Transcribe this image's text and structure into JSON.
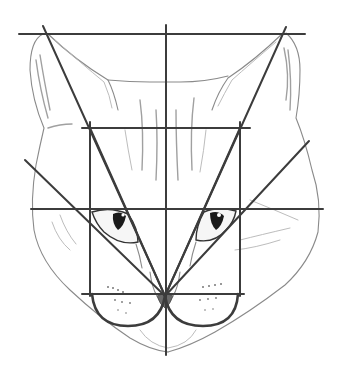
{
  "image": {
    "description": "Pencil sketch of a cat's face overlaid with geometric construction guide lines",
    "width": 344,
    "height": 372,
    "background": "#ffffff"
  },
  "colors": {
    "guide_line": "#3c3c3c",
    "sketch": "#8a8a8a",
    "pupil": "#1a1a1a"
  },
  "guides": {
    "top_line": {
      "x1": 19,
      "y1": 34,
      "x2": 305,
      "y2": 34
    },
    "center_vertical": {
      "x1": 166,
      "y1": 25,
      "x2": 166,
      "y2": 355
    },
    "brow_line": {
      "x1": 82,
      "y1": 128,
      "x2": 250,
      "y2": 128
    },
    "eye_line": {
      "x1": 31,
      "y1": 209,
      "x2": 323,
      "y2": 209
    },
    "muzzle_line": {
      "x1": 82,
      "y1": 294,
      "x2": 244,
      "y2": 294
    },
    "rect_left": {
      "x1": 90,
      "y1": 122,
      "x2": 90,
      "y2": 296
    },
    "rect_right": {
      "x1": 240,
      "y1": 122,
      "x2": 240,
      "y2": 296
    },
    "convergence_point": {
      "x": 165,
      "y": 296
    },
    "rays": [
      {
        "name": "left-ear-ray",
        "x1": 43,
        "y1": 26,
        "x2": 165,
        "y2": 296
      },
      {
        "name": "right-ear-ray",
        "x1": 286,
        "y1": 27,
        "x2": 165,
        "y2": 296
      },
      {
        "name": "left-cheek-ray",
        "x1": 25,
        "y1": 160,
        "x2": 165,
        "y2": 296
      },
      {
        "name": "right-cheek-ray",
        "x1": 309,
        "y1": 141,
        "x2": 165,
        "y2": 296
      },
      {
        "name": "left-brow-ray",
        "x1": 90,
        "y1": 128,
        "x2": 165,
        "y2": 296
      },
      {
        "name": "right-brow-ray",
        "x1": 240,
        "y1": 128,
        "x2": 165,
        "y2": 296
      }
    ],
    "muzzle_arcs": [
      {
        "name": "left-muzzle-arc",
        "d": "M92 294 Q95 326 128 326 Q160 326 165 296"
      },
      {
        "name": "right-muzzle-arc",
        "d": "M165 296 Q170 326 203 326 Q236 326 238 294"
      }
    ]
  }
}
